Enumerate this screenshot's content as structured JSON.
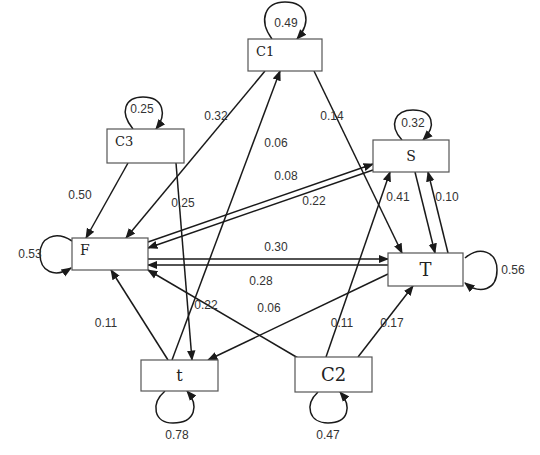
{
  "nodes": [
    {
      "id": "C1",
      "label": "C1",
      "x": 248,
      "y": 39,
      "w": 74,
      "h": 32,
      "align": "left",
      "fontSize": 13
    },
    {
      "id": "C3",
      "label": "C3",
      "x": 107,
      "y": 129,
      "w": 77,
      "h": 34,
      "align": "left",
      "fontSize": 13
    },
    {
      "id": "S",
      "label": "S",
      "x": 373,
      "y": 140,
      "w": 76,
      "h": 32,
      "align": "center",
      "fontSize": 14
    },
    {
      "id": "F",
      "label": "F",
      "x": 72,
      "y": 238,
      "w": 76,
      "h": 32,
      "align": "left",
      "fontSize": 14
    },
    {
      "id": "T",
      "label": "T",
      "x": 388,
      "y": 253,
      "w": 75,
      "h": 33,
      "align": "center",
      "fontSize": 18
    },
    {
      "id": "t",
      "label": "t",
      "x": 141,
      "y": 360,
      "w": 77,
      "h": 31,
      "align": "center",
      "fontSize": 16
    },
    {
      "id": "C2",
      "label": "C2",
      "x": 295,
      "y": 357,
      "w": 77,
      "h": 35,
      "align": "center",
      "fontSize": 18
    }
  ],
  "edges": [
    {
      "from": "C3",
      "to": "F",
      "label": "0.50",
      "x1": 128,
      "y1": 163,
      "x2": 86,
      "y2": 238,
      "lx": 80,
      "ly": 199
    },
    {
      "from": "C1",
      "to": "F",
      "label": "0.32",
      "x1": 265,
      "y1": 71,
      "x2": 126,
      "y2": 238,
      "lx": 216,
      "ly": 120
    },
    {
      "from": "C3",
      "to": "t",
      "label": "0.25",
      "x1": 176,
      "y1": 163,
      "x2": 192,
      "y2": 360,
      "lx": 183,
      "ly": 207
    },
    {
      "from": "t",
      "to": "C1",
      "label": "0.06",
      "x1": 172,
      "y1": 360,
      "x2": 280,
      "y2": 71,
      "lx": 276,
      "ly": 147
    },
    {
      "from": "C1",
      "to": "T",
      "label": "0.14",
      "x1": 314,
      "y1": 71,
      "x2": 402,
      "y2": 253,
      "lx": 332,
      "ly": 120
    },
    {
      "from": "F",
      "to": "S",
      "label": "0.08",
      "x1": 148,
      "y1": 242,
      "x2": 373,
      "y2": 164,
      "lx": 286,
      "ly": 180
    },
    {
      "from": "S",
      "to": "F",
      "label": "0.22",
      "x1": 373,
      "y1": 170,
      "x2": 148,
      "y2": 248,
      "lx": 314,
      "ly": 205
    },
    {
      "from": "F",
      "to": "T",
      "label": "0.30",
      "x1": 148,
      "y1": 259,
      "x2": 388,
      "y2": 259,
      "lx": 276,
      "ly": 251
    },
    {
      "from": "T",
      "to": "F",
      "label": "0.28",
      "x1": 388,
      "y1": 265,
      "x2": 148,
      "y2": 265,
      "lx": 261,
      "ly": 285
    },
    {
      "from": "C2",
      "to": "F",
      "label": "0.22",
      "x1": 298,
      "y1": 358,
      "x2": 148,
      "y2": 270,
      "lx": 206,
      "ly": 309
    },
    {
      "from": "T",
      "to": "t",
      "label": "0.06",
      "x1": 388,
      "y1": 274,
      "x2": 208,
      "y2": 360,
      "lx": 269,
      "ly": 312
    },
    {
      "from": "C2",
      "to": "S",
      "label": "0.11",
      "x1": 326,
      "y1": 357,
      "x2": 390,
      "y2": 172,
      "lx": 342,
      "ly": 327
    },
    {
      "from": "C2",
      "to": "T",
      "label": "0.17",
      "x1": 358,
      "y1": 357,
      "x2": 413,
      "y2": 286,
      "lx": 392,
      "ly": 327
    },
    {
      "from": "S",
      "to": "T",
      "label": "0.41",
      "x1": 415,
      "y1": 172,
      "x2": 435,
      "y2": 253,
      "lx": 398,
      "ly": 201
    },
    {
      "from": "T",
      "to": "S",
      "label": "0.10",
      "x1": 448,
      "y1": 253,
      "x2": 428,
      "y2": 172,
      "lx": 447,
      "ly": 201
    },
    {
      "from": "t",
      "to": "F",
      "label": "0.11",
      "x1": 168,
      "y1": 360,
      "x2": 111,
      "y2": 270,
      "lx": 106,
      "ly": 327
    }
  ],
  "self_loops": [
    {
      "node": "C1",
      "label": "0.49",
      "lx": 286,
      "ly": 27
    },
    {
      "node": "C3",
      "label": "0.25",
      "lx": 142,
      "ly": 113
    },
    {
      "node": "S",
      "label": "0.32",
      "lx": 413,
      "ly": 127
    },
    {
      "node": "F",
      "label": "0.53",
      "lx": 30,
      "ly": 258
    },
    {
      "node": "T",
      "label": "0.56",
      "lx": 513,
      "ly": 274
    },
    {
      "node": "t",
      "label": "0.78",
      "lx": 177,
      "ly": 439
    },
    {
      "node": "C2",
      "label": "0.47",
      "lx": 328,
      "ly": 439
    }
  ],
  "colors": {
    "line": "#1a1a1a",
    "box_border": "#555555",
    "text": "#333333"
  }
}
